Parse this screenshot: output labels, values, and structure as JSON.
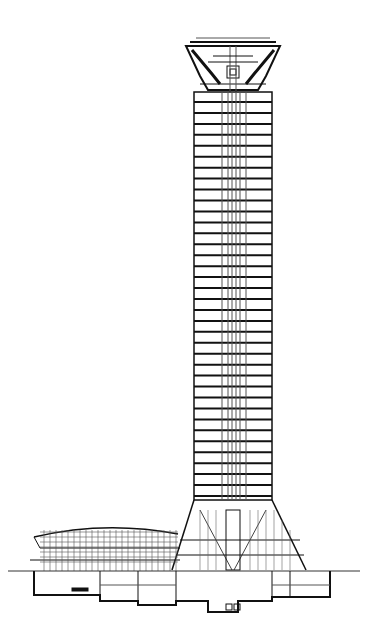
{
  "drawing": {
    "title": "Tower section drawing",
    "type": "architectural-section",
    "colors": {
      "ink": "#111111",
      "background": "#ffffff",
      "hatch": "#555555"
    },
    "tower": {
      "shaft": {
        "x_left": 194,
        "x_right": 272,
        "y_top": 92,
        "y_bottom": 500
      },
      "floors_count": 36,
      "core": {
        "x_left": 228,
        "x_right": 240
      }
    },
    "crown": {
      "y_top": 40,
      "y_bottom": 92,
      "top_width": [
        186,
        280
      ],
      "bottom_width": [
        200,
        266
      ]
    },
    "base_cone": {
      "y_top": 500,
      "y_bottom": 570,
      "x_left_bottom": 170,
      "x_right_bottom": 308
    },
    "podium": {
      "roof_y": 527,
      "x_left": 30,
      "x_right": 180,
      "label": ""
    },
    "ground_line_y": 570,
    "basement": {
      "y_bottom": 632
    }
  }
}
